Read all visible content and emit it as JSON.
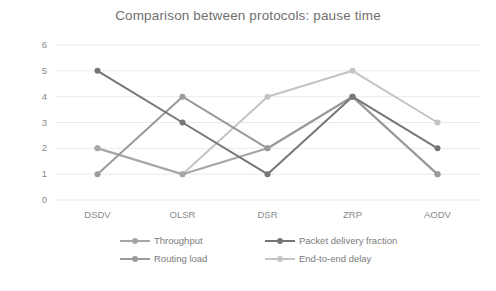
{
  "chart_data": {
    "type": "line",
    "title": "Comparison between protocols: pause time",
    "xlabel": "",
    "ylabel": "",
    "categories": [
      "DSDV",
      "OLSR",
      "DSR",
      "ZRP",
      "AODV"
    ],
    "ylim": [
      0,
      6
    ],
    "yticks": [
      0,
      1,
      2,
      3,
      4,
      5,
      6
    ],
    "grid": true,
    "legend_position": "bottom",
    "series": [
      {
        "name": "Throughput",
        "values": [
          2,
          1,
          2,
          4,
          1
        ],
        "color": "#a6a6a6"
      },
      {
        "name": "Packet delivery fraction",
        "values": [
          5,
          3,
          1,
          4,
          2
        ],
        "color": "#767676"
      },
      {
        "name": "Routing load",
        "values": [
          1,
          4,
          2,
          4,
          1
        ],
        "color": "#9a9a9a"
      },
      {
        "name": "End-to-end delay",
        "values": [
          2,
          1,
          4,
          5,
          3
        ],
        "color": "#c4c4c4"
      }
    ]
  },
  "axis": {
    "y_tick_labels": [
      "6",
      "5",
      "4",
      "3",
      "2",
      "1",
      "0"
    ],
    "x_tick_labels": [
      "DSDV",
      "OLSR",
      "DSR",
      "ZRP",
      "AODV"
    ]
  },
  "legend": {
    "entries": [
      {
        "label": "Throughput"
      },
      {
        "label": "Packet delivery fraction"
      },
      {
        "label": "Routing load"
      },
      {
        "label": "End-to-end delay"
      }
    ]
  },
  "style": {
    "grid_color": "#eceaea",
    "axis_text_color": "#8a8a8a",
    "title_color": "#6f6f6f",
    "background": "#ffffff"
  }
}
